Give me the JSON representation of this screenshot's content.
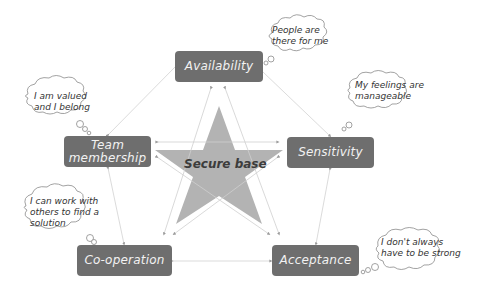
{
  "diagram": {
    "title": "Secure base",
    "colors": {
      "node_fill": "#6e6e6e",
      "node_text": "#f2f2f2",
      "star_fill": "#b3b3b3",
      "connector": "#c8c8c8",
      "cloud_stroke": "#8a8a8a"
    },
    "center": {
      "label": "Secure base",
      "shape": "star"
    },
    "nodes": [
      {
        "id": "availability",
        "label": "Availability"
      },
      {
        "id": "sensitivity",
        "label": "Sensitivity"
      },
      {
        "id": "acceptance",
        "label": "Acceptance"
      },
      {
        "id": "cooperation",
        "label": "Co-operation"
      },
      {
        "id": "team",
        "label": "Team\nmembership"
      }
    ],
    "thoughts": [
      {
        "node": "availability",
        "text": "People are\nthere for me"
      },
      {
        "node": "sensitivity",
        "text": "My feelings are\nmanageable"
      },
      {
        "node": "acceptance",
        "text": "I don't always\nhave to be strong"
      },
      {
        "node": "cooperation",
        "text": "I can work with\nothers to find a\nsolution"
      },
      {
        "node": "team",
        "text": "I am valued\nand I belong"
      }
    ]
  }
}
